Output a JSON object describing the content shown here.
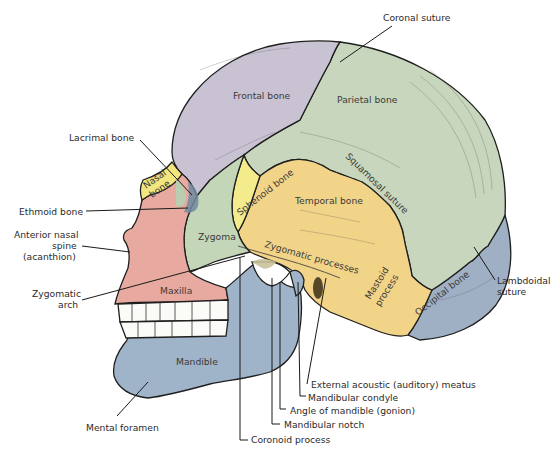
{
  "diagram": {
    "type": "anatomical-illustration",
    "bones": [
      {
        "id": "frontal",
        "label": "Frontal bone",
        "color": "#c9c2d3"
      },
      {
        "id": "parietal",
        "label": "Parietal bone",
        "color": "#c7d6bd"
      },
      {
        "id": "temporal",
        "label": "Temporal bone",
        "color": "#f2d488"
      },
      {
        "id": "sphenoid",
        "label": "Sphenoid bone",
        "color": "#f4ec8c"
      },
      {
        "id": "occipital",
        "label": "Occipital bone",
        "color": "#9fb0c4"
      },
      {
        "id": "zygoma",
        "label": "Zygoma",
        "color": "#c4d6b8"
      },
      {
        "id": "maxilla",
        "label": "Maxilla",
        "color": "#e8aaa0"
      },
      {
        "id": "mandible",
        "label": "Mandible",
        "color": "#9fb4c8"
      },
      {
        "id": "nasal",
        "label": "Nasal bone",
        "label_line1": "Nasal",
        "label_line2": "bone",
        "color": "#f3e67e"
      },
      {
        "id": "mastoid",
        "label": "Mastoid process",
        "label_line1": "Mastoid",
        "label_line2": "process"
      },
      {
        "id": "zygomatic-processes",
        "label": "Zygomatic processes"
      },
      {
        "id": "squamosal-suture",
        "label": "Squamosal suture"
      }
    ],
    "callouts": [
      {
        "id": "coronal-suture",
        "text": "Coronal suture"
      },
      {
        "id": "lacrimal-bone",
        "text": "Lacrimal bone"
      },
      {
        "id": "ethmoid-bone",
        "text": "Ethmoid bone"
      },
      {
        "id": "anterior-nasal-spine",
        "line1": "Anterior nasal",
        "line2": "spine",
        "line3": "(acanthion)"
      },
      {
        "id": "zygomatic-arch",
        "line1": "Zygomatic",
        "line2": "arch"
      },
      {
        "id": "mental-foramen",
        "text": "Mental foramen"
      },
      {
        "id": "lambdoidal-suture",
        "line1": "Lambdoidal",
        "line2": "suture"
      },
      {
        "id": "external-acoustic-meatus",
        "text": "External acoustic (auditory) meatus"
      },
      {
        "id": "mandibular-condyle",
        "text": "Mandibular condyle"
      },
      {
        "id": "angle-of-mandible",
        "text": "Angle of mandible (gonion)"
      },
      {
        "id": "mandibular-notch",
        "text": "Mandibular notch"
      },
      {
        "id": "coronoid-process",
        "text": "Coronoid process"
      }
    ],
    "colors": {
      "background": "#ffffff",
      "outline": "#1f1f1f",
      "label_text": "#2b2b2b",
      "teeth": "#fbfbf8",
      "orbit_shadow": "#6f8aa0"
    }
  }
}
